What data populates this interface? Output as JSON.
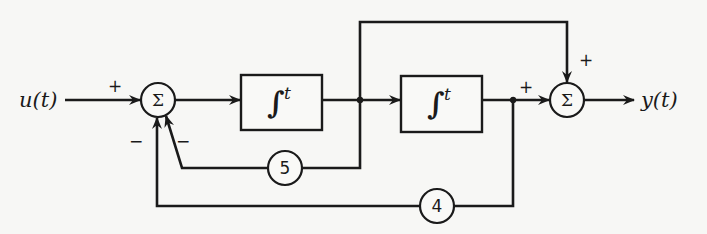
{
  "diagram": {
    "input_label": "u(t)",
    "output_label": "y(t)",
    "summing_junction_1": {
      "symbol": "Σ",
      "input_signs": {
        "u": "+",
        "gain5": "−",
        "gain4": "−"
      }
    },
    "summing_junction_2": {
      "symbol": "Σ",
      "input_signs": {
        "top_feedforward": "+",
        "left": "+"
      }
    },
    "integrator_1": {
      "symbol": "∫",
      "superscript": "t"
    },
    "integrator_2": {
      "symbol": "∫",
      "superscript": "t"
    },
    "gain_5": {
      "value": "5"
    },
    "gain_4": {
      "value": "4"
    },
    "colors": {
      "ink": "#1a1a1a",
      "paper": "#f7f7f5"
    }
  }
}
